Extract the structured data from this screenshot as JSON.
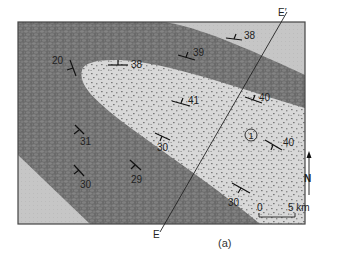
{
  "figure": {
    "caption": "(a)",
    "section_line": {
      "start_label": "E",
      "end_label": "E′"
    },
    "unit_label": "1",
    "north_label": "N",
    "scale_bar": {
      "start": "0",
      "end": "5 km"
    }
  },
  "colors": {
    "outer_unit": "#c4c4c4",
    "middle_unit": "#6e6e6e",
    "core_unit": "#d6d6d6",
    "frame": "#444444",
    "symbol": "#111111"
  },
  "dip_measurements": [
    {
      "value": "20",
      "x": 36,
      "y": 66
    },
    {
      "value": "38",
      "x": 137,
      "y": 67
    },
    {
      "value": "39",
      "x": 197,
      "y": 52
    },
    {
      "value": "38",
      "x": 243,
      "y": 36
    },
    {
      "value": "40",
      "x": 264,
      "y": 97
    },
    {
      "value": "41",
      "x": 189,
      "y": 104
    },
    {
      "value": "31",
      "x": 82,
      "y": 137
    },
    {
      "value": "30",
      "x": 160,
      "y": 148
    },
    {
      "value": "40",
      "x": 280,
      "y": 145
    },
    {
      "value": "30",
      "x": 84,
      "y": 188
    },
    {
      "value": "29",
      "x": 137,
      "y": 180
    },
    {
      "value": "30",
      "x": 232,
      "y": 206
    }
  ]
}
